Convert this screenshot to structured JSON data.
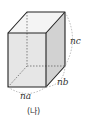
{
  "diagram": {
    "type": "rectangular-prism",
    "labels": {
      "width": "na",
      "depth": "nb",
      "height": "nc"
    },
    "caption": "(나)",
    "colors": {
      "front_face": "#e6e6e6",
      "side_face": "#d2d2d2",
      "top_face": "#f4f4f4",
      "edges": "#222222",
      "hidden_edges": "#555555",
      "arcs": "#999999"
    }
  }
}
